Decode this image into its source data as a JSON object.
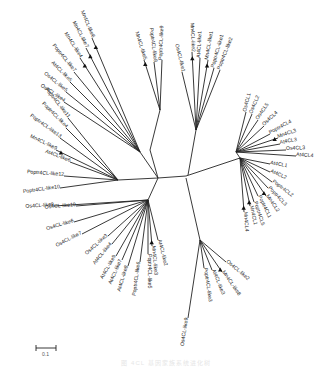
{
  "figure": {
    "type": "unrooted phylogenetic tree",
    "scale_bar_label": "0.1",
    "caption_text": "图 4CL 基因家族系统进化树"
  },
  "colors": {
    "branch": "#222222",
    "label": "#222222",
    "marker": "#111111"
  },
  "nodes": {
    "center_left": [
      158,
      178
    ],
    "center_right": [
      188,
      175
    ],
    "center_bottom": [
      186,
      178
    ]
  },
  "clusters": [
    {
      "name": "upper-left-cluster",
      "hub": [
        140,
        152
      ],
      "leaves": [
        {
          "label": "Mn4CL-like6",
          "tip": [
            92,
            38
          ],
          "text_at": [
            72,
            12
          ],
          "angle": 80,
          "marker": true
        },
        {
          "label": "Mn4CL-like7",
          "tip": [
            86,
            48
          ],
          "text_at": [
            62,
            28
          ],
          "angle": 65,
          "marker": true
        },
        {
          "label": "Mn4CL-like4",
          "tip": [
            80,
            58
          ],
          "text_at": [
            55,
            40
          ],
          "angle": 55,
          "marker": true
        },
        {
          "label": "Poptr4CL-like7",
          "tip": [
            74,
            72
          ],
          "text_at": [
            38,
            48
          ],
          "angle": 40,
          "marker": false
        },
        {
          "label": "At4CL-like5",
          "tip": [
            70,
            82
          ],
          "text_at": [
            42,
            64
          ],
          "angle": 35,
          "marker": false
        },
        {
          "label": "Os4CL-like5",
          "tip": [
            66,
            92
          ],
          "text_at": [
            38,
            78
          ],
          "angle": 30,
          "marker": false
        },
        {
          "label": "Os4CL-like4",
          "tip": [
            64,
            102
          ],
          "text_at": [
            34,
            92
          ],
          "angle": 25,
          "marker": false
        }
      ]
    },
    {
      "name": "upper-center-cluster",
      "hub": [
        160,
        110
      ],
      "leaves": [
        {
          "label": "Mn4CL-like5",
          "tip": [
            144,
            60
          ],
          "text_at": [
            134,
            28
          ],
          "angle": 65,
          "marker": true
        },
        {
          "label": "Poptr4CL-like8",
          "tip": [
            154,
            62
          ],
          "text_at": [
            148,
            24
          ],
          "angle": 80,
          "marker": false
        },
        {
          "label": "Poptr4CL-like9",
          "tip": [
            162,
            60
          ],
          "text_at": [
            160,
            24
          ],
          "angle": 85,
          "marker": false
        }
      ]
    },
    {
      "name": "top-cluster",
      "hub": [
        196,
        130
      ],
      "leaves": [
        {
          "label": "Os4CL-like1",
          "tip": [
            182,
            72
          ],
          "text_at": [
            178,
            46
          ],
          "angle": 90,
          "marker": false
        },
        {
          "label": "Mn4CL-like2",
          "tip": [
            192,
            52
          ],
          "text_at": [
            190,
            20
          ],
          "angle": 85,
          "marker": true
        },
        {
          "label": "At4CL-like1",
          "tip": [
            200,
            58
          ],
          "text_at": [
            200,
            32
          ],
          "angle": 80,
          "marker": false
        },
        {
          "label": "Mn4CL-like1",
          "tip": [
            208,
            60
          ],
          "text_at": [
            212,
            32
          ],
          "angle": 70,
          "marker": true
        },
        {
          "label": "Poptr4CL-like1",
          "tip": [
            214,
            68
          ],
          "text_at": [
            222,
            40
          ],
          "angle": 50,
          "marker": false
        },
        {
          "label": "Poptr4CL-like2",
          "tip": [
            220,
            70
          ],
          "text_at": [
            232,
            42
          ],
          "angle": 40,
          "marker": false
        }
      ]
    },
    {
      "name": "left-cluster",
      "hub": [
        118,
        180
      ],
      "leaves": [
        {
          "label": "Poptr4CL-like11",
          "tip": [
            68,
            118
          ],
          "text_at": [
            34,
            94
          ],
          "angle": -20,
          "marker": false
        },
        {
          "label": "Poptr4CL-like4",
          "tip": [
            66,
            128
          ],
          "text_at": [
            32,
            106
          ],
          "angle": -18,
          "marker": false
        },
        {
          "label": "Poptr4CL-like13",
          "tip": [
            60,
            138
          ],
          "text_at": [
            18,
            120
          ],
          "angle": -15,
          "marker": false
        },
        {
          "label": "Mn4CL-like9",
          "tip": [
            56,
            150
          ],
          "text_at": [
            18,
            136
          ],
          "angle": -10,
          "marker": true
        },
        {
          "label": "At4CL-like6",
          "tip": [
            70,
            162
          ],
          "text_at": [
            38,
            160
          ],
          "angle": 0,
          "marker": false
        },
        {
          "label": "Poptr4CL-like12",
          "tip": [
            64,
            176
          ],
          "text_at": [
            24,
            176
          ],
          "angle": 12,
          "marker": false
        },
        {
          "label": "Poptr4CL-like10",
          "tip": [
            60,
            188
          ],
          "text_at": [
            24,
            190
          ],
          "angle": 18,
          "marker": false
        }
      ]
    },
    {
      "name": "lower-left-cluster",
      "hub": [
        148,
        200
      ],
      "leaves": [
        {
          "label": "Os4CL-like8",
          "tip": [
            54,
            206
          ],
          "text_at": [
            18,
            204
          ],
          "angle": 20,
          "marker": false
        },
        {
          "label": "Os4CL-like10",
          "tip": [
            76,
            206
          ],
          "text_at": [
            44,
            206
          ],
          "angle": 22,
          "marker": false
        },
        {
          "label": "Os4CL-like6",
          "tip": [
            74,
            222
          ],
          "text_at": [
            44,
            220
          ],
          "angle": 28,
          "marker": false
        },
        {
          "label": "Os4CL-like7",
          "tip": [
            82,
            234
          ],
          "text_at": [
            52,
            236
          ],
          "angle": 32,
          "marker": false
        },
        {
          "label": "Os4CL-like3",
          "tip": [
            108,
            236
          ],
          "text_at": [
            84,
            232
          ],
          "angle": 40,
          "marker": false
        },
        {
          "label": "At4CL-like4",
          "tip": [
            112,
            244
          ],
          "text_at": [
            88,
            248
          ],
          "angle": 50,
          "marker": false
        },
        {
          "label": "At4CL-like9",
          "tip": [
            116,
            256
          ],
          "text_at": [
            94,
            262
          ],
          "angle": 60,
          "marker": false
        },
        {
          "label": "At4CL-like7",
          "tip": [
            122,
            260
          ],
          "text_at": [
            104,
            268
          ],
          "angle": 65,
          "marker": false
        },
        {
          "label": "At4CL-like8",
          "tip": [
            128,
            266
          ],
          "text_at": [
            114,
            280
          ],
          "angle": 70,
          "marker": false
        },
        {
          "label": "Poptr4CL-like6",
          "tip": [
            140,
            262
          ],
          "text_at": [
            130,
            282
          ],
          "angle": 75,
          "marker": false
        },
        {
          "label": "Poptr4CL-like5",
          "tip": [
            148,
            254
          ],
          "text_at": [
            142,
            272
          ],
          "angle": 80,
          "marker": false
        },
        {
          "label": "Mn4CL-like3",
          "tip": [
            152,
            246
          ],
          "text_at": [
            152,
            268
          ],
          "angle": 75,
          "marker": true
        },
        {
          "label": "At4CL-like2",
          "tip": [
            158,
            240
          ],
          "text_at": [
            162,
            264
          ],
          "angle": 65,
          "marker": false
        }
      ]
    },
    {
      "name": "bottom-cluster",
      "hub": [
        200,
        240
      ],
      "leaves": [
        {
          "label": "Os4CL-like9",
          "tip": [
            188,
            318
          ],
          "text_at": [
            186,
            328
          ],
          "angle": 90,
          "marker": false
        },
        {
          "label": "Poptr4CL-like3",
          "tip": [
            204,
            268
          ],
          "text_at": [
            200,
            272
          ],
          "angle": 85,
          "marker": false
        },
        {
          "label": "At4CL-like3",
          "tip": [
            212,
            270
          ],
          "text_at": [
            212,
            272
          ],
          "angle": 75,
          "marker": false
        },
        {
          "label": "Mn4CL-like8",
          "tip": [
            222,
            272
          ],
          "text_at": [
            224,
            282
          ],
          "angle": 65,
          "marker": true
        },
        {
          "label": "Os4CL-like2",
          "tip": [
            226,
            262
          ],
          "text_at": [
            228,
            262
          ],
          "angle": 55,
          "marker": false
        }
      ]
    },
    {
      "name": "right-upper-cluster",
      "hub": [
        236,
        152
      ],
      "leaves": [
        {
          "label": "Os4CL1",
          "tip": [
            246,
            112
          ],
          "text_at": [
            246,
            96
          ],
          "angle": -70,
          "marker": false
        },
        {
          "label": "Os4CL2",
          "tip": [
            252,
            114
          ],
          "text_at": [
            254,
            100
          ],
          "angle": -65,
          "marker": false
        },
        {
          "label": "Os4CL5",
          "tip": [
            258,
            120
          ],
          "text_at": [
            262,
            106
          ],
          "angle": -60,
          "marker": false
        },
        {
          "label": "Os4CL4",
          "tip": [
            264,
            126
          ],
          "text_at": [
            270,
            112
          ],
          "angle": -55,
          "marker": false
        },
        {
          "label": "Poptr4CL4",
          "tip": [
            270,
            134
          ],
          "text_at": [
            276,
            120
          ],
          "angle": -45,
          "marker": false
        },
        {
          "label": "Mn4CL3",
          "tip": [
            278,
            138
          ],
          "text_at": [
            286,
            128
          ],
          "angle": -35,
          "marker": true
        },
        {
          "label": "At4CL3",
          "tip": [
            280,
            144
          ],
          "text_at": [
            286,
            140
          ],
          "angle": -20,
          "marker": false
        },
        {
          "label": "Os4CL3",
          "tip": [
            286,
            150
          ],
          "text_at": [
            288,
            150
          ],
          "angle": -10,
          "marker": false
        },
        {
          "label": "At4CL4",
          "tip": [
            296,
            156
          ],
          "text_at": [
            298,
            156
          ],
          "angle": -5,
          "marker": false
        }
      ]
    },
    {
      "name": "right-lower-cluster",
      "hub": [
        240,
        158
      ],
      "leaves": [
        {
          "label": "At4CL1",
          "tip": [
            270,
            164
          ],
          "text_at": [
            272,
            164
          ],
          "angle": 10,
          "marker": false
        },
        {
          "label": "At4CL2",
          "tip": [
            270,
            172
          ],
          "text_at": [
            272,
            172
          ],
          "angle": 18,
          "marker": false
        },
        {
          "label": "Poptr4CL2",
          "tip": [
            272,
            182
          ],
          "text_at": [
            274,
            184
          ],
          "angle": 30,
          "marker": false
        },
        {
          "label": "Poptr4CL3",
          "tip": [
            268,
            188
          ],
          "text_at": [
            272,
            190
          ],
          "angle": 35,
          "marker": false
        },
        {
          "label": "Mn4CL2",
          "tip": [
            266,
            196
          ],
          "text_at": [
            270,
            198
          ],
          "angle": 45,
          "marker": true
        },
        {
          "label": "Poptr4CL1",
          "tip": [
            258,
            196
          ],
          "text_at": [
            260,
            198
          ],
          "angle": 55,
          "marker": false
        },
        {
          "label": "Poptr4CL5",
          "tip": [
            254,
            202
          ],
          "text_at": [
            256,
            204
          ],
          "angle": 60,
          "marker": false
        },
        {
          "label": "Mn4CL1",
          "tip": [
            250,
            206
          ],
          "text_at": [
            252,
            208
          ],
          "angle": 65,
          "marker": true
        },
        {
          "label": "Mn4CL4",
          "tip": [
            244,
            212
          ],
          "text_at": [
            246,
            218
          ],
          "angle": 75,
          "marker": true
        }
      ]
    }
  ]
}
